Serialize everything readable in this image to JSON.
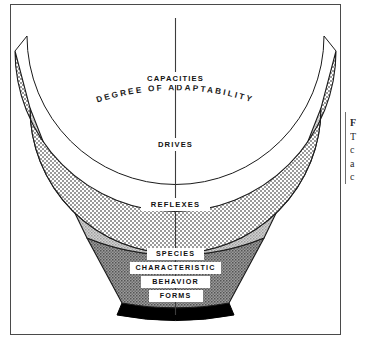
{
  "figure": {
    "arc_title": "DEGREE OF ADAPTABILITY",
    "center_axis": "vertical-axis-line",
    "bands": [
      {
        "id": "capacities",
        "label": "CAPACITIES",
        "label_lines": [
          "CAPACITIES"
        ],
        "fill": "#fbfbfb",
        "pattern": "fine-crosshatch-dots",
        "order_from_top": 1
      },
      {
        "id": "drives",
        "label": "DRIVES",
        "label_lines": [
          "DRIVES"
        ],
        "fill": "#d4d4d4",
        "pattern": "light-checker",
        "order_from_top": 2
      },
      {
        "id": "reflexes",
        "label": "REFLEXES",
        "label_lines": [
          "REFLEXES"
        ],
        "fill": "#c2c2c2",
        "pattern": "medium-stipple",
        "order_from_top": 3
      },
      {
        "id": "species-characteristic-behavior-forms",
        "label": "SPECIES CHARACTERISTIC BEHAVIOR FORMS",
        "label_lines": [
          "SPECIES",
          "CHARACTERISTIC",
          "BEHAVIOR",
          "FORMS"
        ],
        "fill": "#8f8f8f",
        "pattern": "dark-stipple",
        "order_from_top": 4
      },
      {
        "id": "base-bar",
        "label": "",
        "label_lines": [],
        "fill": "#000000",
        "pattern": "solid",
        "order_from_top": 5
      }
    ],
    "side_caption": {
      "lines": [
        "F",
        "T",
        "c",
        "a",
        "c"
      ]
    },
    "colors": {
      "frame": "#4a4a4a",
      "outline": "#1a1a1a",
      "background": "#ffffff",
      "label_text": "#111111"
    }
  }
}
